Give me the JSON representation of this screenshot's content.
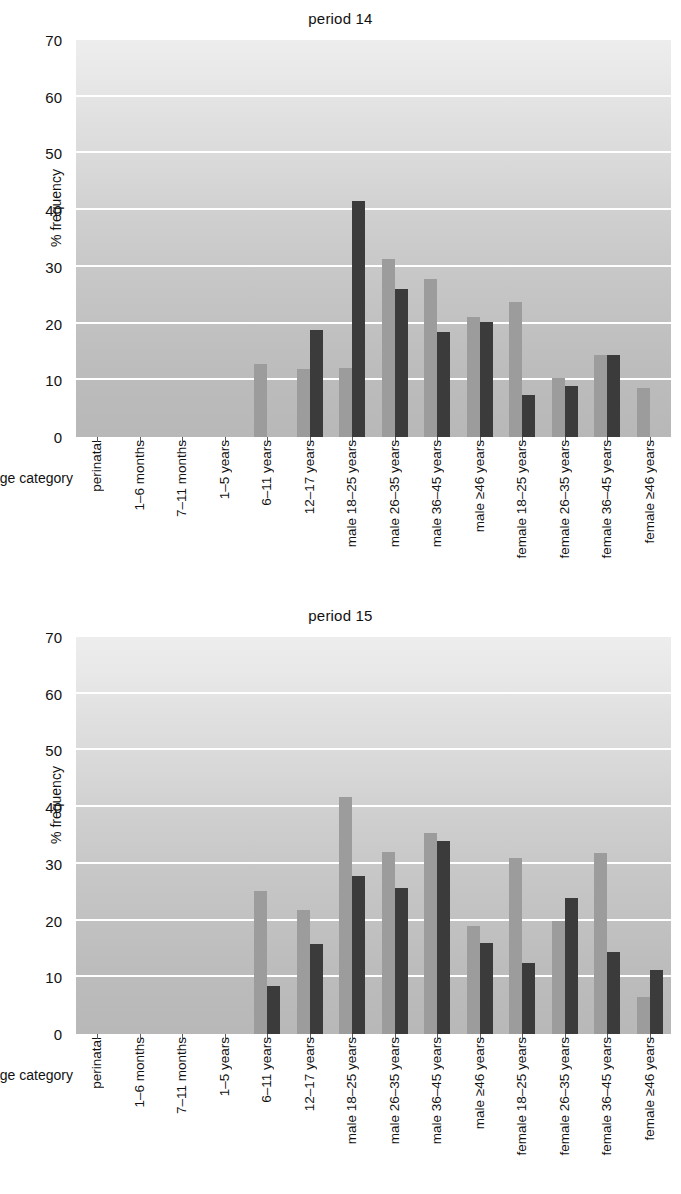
{
  "axis": {
    "ylabel": "% frequency",
    "xlabel": "age category",
    "yticks": [
      "70",
      "60",
      "50",
      "40",
      "30",
      "20",
      "10",
      "0"
    ],
    "categories": [
      "perinatal",
      "1–6 months",
      "7–11 months",
      "1–5 years",
      "6–11 years",
      "12–17 years",
      "male 18–25 years",
      "male 26–35 years",
      "male 36–45 years",
      "male ≥46 years",
      "female 18–25 years",
      "female 26–35 years",
      "female 36–45 years",
      "female ≥46 years"
    ]
  },
  "colors": {
    "bar_light": "#9c9c9c",
    "bar_dark": "#3b3b3b",
    "plot_background": "#c9c9c9",
    "gridline": "#ffffff",
    "text": "#111111"
  },
  "panels": [
    {
      "title": "period 14"
    },
    {
      "title": "period 15"
    }
  ],
  "chart_data": [
    {
      "type": "bar",
      "title": "period 14",
      "xlabel": "age category",
      "ylabel": "% frequency",
      "ylim": [
        0,
        70
      ],
      "ytick_step": 10,
      "grid": true,
      "legend": "none",
      "categories": [
        "perinatal",
        "1–6 months",
        "7–11 months",
        "1–5 years",
        "6–11 years",
        "12–17 years",
        "male 18–25 years",
        "male 26–35 years",
        "male 36–45 years",
        "male ≥46 years",
        "female 18–25 years",
        "female 26–35 years",
        "female 36–45 years",
        "female ≥46 years"
      ],
      "series": [
        {
          "name": "light",
          "color": "#9c9c9c",
          "values": [
            0,
            0,
            0,
            0,
            12.9,
            12.0,
            12.2,
            31.4,
            27.8,
            21.2,
            23.8,
            10.4,
            14.5,
            8.7
          ]
        },
        {
          "name": "dark",
          "color": "#3b3b3b",
          "values": [
            0,
            0,
            0,
            0,
            0,
            18.8,
            41.7,
            26.1,
            18.6,
            20.2,
            7.4,
            9.0,
            14.5,
            0
          ]
        }
      ]
    },
    {
      "type": "bar",
      "title": "period 15",
      "xlabel": "age category",
      "ylabel": "% frequency",
      "ylim": [
        0,
        70
      ],
      "ytick_step": 10,
      "grid": true,
      "legend": "none",
      "categories": [
        "perinatal",
        "1–6 months",
        "7–11 months",
        "1–5 years",
        "6–11 years",
        "12–17 years",
        "male 18–25 years",
        "male 26–35 years",
        "male 36–45 years",
        "male ≥46 years",
        "female 18–25 years",
        "female 26–35 years",
        "female 36–45 years",
        "female ≥46 years"
      ],
      "series": [
        {
          "name": "light",
          "color": "#9c9c9c",
          "values": [
            0,
            0,
            0,
            0,
            25.2,
            21.9,
            41.8,
            32.1,
            35.5,
            19.0,
            31.0,
            19.9,
            32.0,
            6.5
          ]
        },
        {
          "name": "dark",
          "color": "#3b3b3b",
          "values": [
            0,
            0,
            0,
            0,
            8.4,
            15.8,
            27.8,
            25.8,
            34.1,
            16.1,
            12.5,
            23.9,
            14.4,
            11.3
          ]
        }
      ]
    }
  ]
}
